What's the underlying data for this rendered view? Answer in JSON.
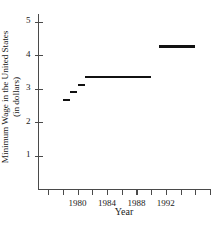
{
  "chart_data": {
    "type": "line",
    "style": "step",
    "title": "",
    "xlabel": "Year",
    "ylabel": "Minimum Wage in the United States (in dollars)",
    "ylabel_line1": "Minimum Wage in the United States",
    "ylabel_line2": "(in dollars)",
    "xlim": [
      1976,
      1998
    ],
    "ylim": [
      0,
      5.3
    ],
    "grid": false,
    "legend": null,
    "y_ticks": [
      1,
      2,
      3,
      4,
      5
    ],
    "y_tick_labels": [
      "1",
      "2",
      "3",
      "4",
      "5"
    ],
    "x_ticks": [
      1976,
      1978,
      1980,
      1982,
      1984,
      1986,
      1988,
      1990,
      1992,
      1994,
      1996,
      1998
    ],
    "x_tick_labels": [
      "1980",
      "1984",
      "1988",
      "1992"
    ],
    "x_labeled_ticks": [
      1980,
      1984,
      1988,
      1992
    ],
    "series_name": "Minimum Wage",
    "line_color": "#111111",
    "axis_color": "#4a4a4a",
    "segments": [
      {
        "label": "2.65",
        "value": 2.65,
        "x_start": 1978.0,
        "x_end": 1979.0
      },
      {
        "label": "2.90",
        "value": 2.9,
        "x_start": 1979.0,
        "x_end": 1980.0
      },
      {
        "label": "3.10",
        "value": 3.1,
        "x_start": 1980.0,
        "x_end": 1981.0
      },
      {
        "label": "3.35",
        "value": 3.35,
        "x_start": 1981.0,
        "x_end": 1990.0
      },
      {
        "label": "4.25",
        "value": 4.25,
        "x_start": 1991.0,
        "x_end": 1996.0
      }
    ],
    "x": [
      1978,
      1979,
      1980,
      1981,
      1991
    ],
    "values": [
      2.65,
      2.9,
      3.1,
      3.35,
      4.25
    ]
  }
}
